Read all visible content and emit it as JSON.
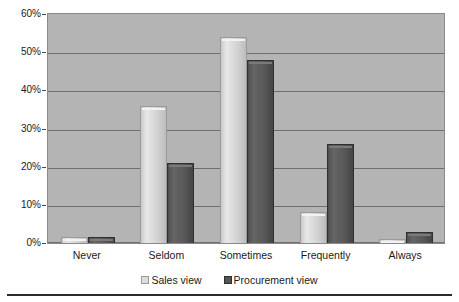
{
  "chart_data": {
    "type": "bar",
    "title": "",
    "subtitle": "",
    "xlabel": "",
    "ylabel": "",
    "categories": [
      "Never",
      "Seldom",
      "Sometimes",
      "Frequently",
      "Always"
    ],
    "series": [
      {
        "name": "Sales view",
        "color": "#dcdcdc",
        "values": [
          1.5,
          36,
          54,
          8,
          1
        ]
      },
      {
        "name": "Procurement view",
        "color": "#555555",
        "values": [
          1.5,
          21,
          48,
          26,
          3
        ]
      }
    ],
    "ylim": [
      0,
      60
    ],
    "y_tick_values": [
      0,
      10,
      20,
      30,
      40,
      50,
      60
    ],
    "y_tick_labels": [
      "0%",
      "10%",
      "20%",
      "30%",
      "40%",
      "50%",
      "60%"
    ],
    "grid": true,
    "grid_axis": "y",
    "legend_position": "bottom",
    "plot_background": "#b4b4b4",
    "figure_background": "#ffffff",
    "annotations": []
  },
  "legend": {
    "entries": [
      {
        "label": "Sales view",
        "swatch": "series-sales-swatch"
      },
      {
        "label": "Procurement view",
        "swatch": "series-procurement-swatch"
      }
    ]
  }
}
